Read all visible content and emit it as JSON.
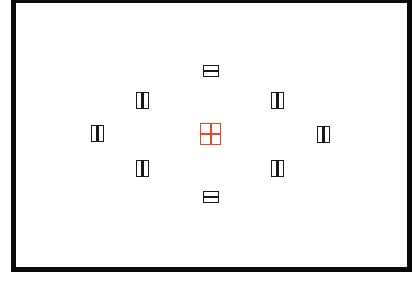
{
  "diagram": {
    "type": "viewfinder-af-point-layout",
    "frame": {
      "border_color": "#0a0a0a",
      "background": "#ffffff"
    },
    "colors": {
      "af_point": "#1a1a1a",
      "selected_af_point": "#e8482a"
    },
    "af_points": [
      {
        "id": "top",
        "orientation": "horizontal",
        "selected": false,
        "x": 203,
        "y": 65
      },
      {
        "id": "upper-left",
        "orientation": "vertical",
        "selected": false,
        "x": 136,
        "y": 92
      },
      {
        "id": "upper-right",
        "orientation": "vertical",
        "selected": false,
        "x": 271,
        "y": 92
      },
      {
        "id": "left",
        "orientation": "vertical",
        "selected": false,
        "x": 91,
        "y": 125
      },
      {
        "id": "center",
        "orientation": "cross",
        "selected": true,
        "x": 200,
        "y": 123
      },
      {
        "id": "right",
        "orientation": "vertical",
        "selected": false,
        "x": 317,
        "y": 126
      },
      {
        "id": "lower-left",
        "orientation": "vertical",
        "selected": false,
        "x": 136,
        "y": 160
      },
      {
        "id": "lower-right",
        "orientation": "vertical",
        "selected": false,
        "x": 271,
        "y": 160
      },
      {
        "id": "bottom",
        "orientation": "horizontal",
        "selected": false,
        "x": 203,
        "y": 191
      }
    ],
    "af_point_count": 9
  }
}
